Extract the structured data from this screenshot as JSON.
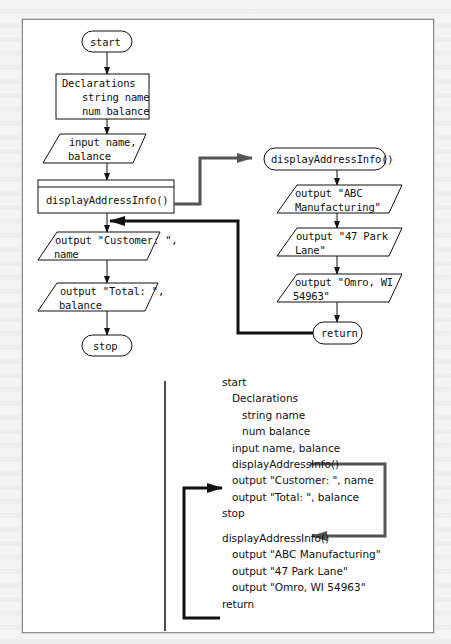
{
  "flowchart": {
    "main": {
      "start": "start",
      "declarations": {
        "title": "Declarations",
        "line1": "string name",
        "line2": "num balance"
      },
      "input": {
        "line1": "input name,",
        "line2": "balance"
      },
      "module_call": "displayAddressInfo()",
      "output_customer": {
        "line1": "output \"Customer: \",",
        "line2": "name"
      },
      "output_total": {
        "line1": "output \"Total: \",",
        "line2": "balance"
      },
      "stop": "stop"
    },
    "module": {
      "header": "displayAddressInfo()",
      "output1": {
        "line1": "output \"ABC",
        "line2": "Manufacturing\""
      },
      "output2": {
        "line1": "output \"47 Park",
        "line2": "Lane\""
      },
      "output3": {
        "line1": "output \"Omro, WI",
        "line2": "54963\""
      },
      "return": "return"
    }
  },
  "pseudocode": {
    "lines": [
      "start",
      "   Declarations",
      "      string name",
      "      num balance",
      "   input name, balance",
      "   displayAddressInfo()",
      "   output \"Customer: \", name",
      "   output \"Total: \", balance",
      "stop",
      "",
      "displayAddressInfo()",
      "   output \"ABC Manufacturing\"",
      "   output \"47 Park Lane\"",
      "   output \"Omro, WI 54963\"",
      "return"
    ]
  },
  "colors": {
    "stroke": "#111111",
    "call_arrow": "#555555",
    "background": "#ffffff"
  }
}
